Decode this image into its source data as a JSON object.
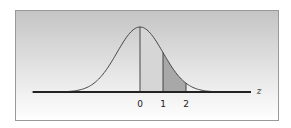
{
  "chart_data": {
    "type": "area",
    "title": "",
    "xlabel": "z",
    "ylabel": "",
    "x_ticks": [
      "0",
      "1",
      "2"
    ],
    "x_tick_values": [
      0,
      1,
      2
    ],
    "shaded_region": {
      "from": 1,
      "to": 2
    },
    "vertical_lines_at": [
      0,
      1,
      2
    ],
    "xlim": [
      -4.7,
      4.9
    ],
    "grid": false,
    "legend": null,
    "colors": {
      "background_top": "#c4c4c4",
      "background_bottom": "#ffffff",
      "curve": "#444444",
      "axis": "#222222",
      "shade": "#a8a8a8",
      "center_fill": "#d6d6d6",
      "border": "#999999"
    }
  }
}
